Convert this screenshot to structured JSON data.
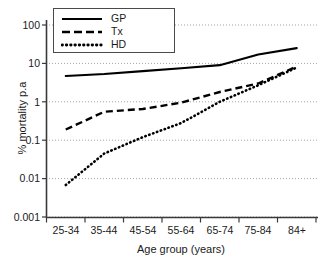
{
  "chart_data": {
    "type": "line",
    "title": "",
    "xlabel": "Age group (years)",
    "ylabel": "% mortality p.a",
    "categories": [
      "25-34",
      "35-44",
      "45-54",
      "55-64",
      "65-74",
      "75-84",
      "84+"
    ],
    "yscale": "log",
    "ylim": [
      0.001,
      100
    ],
    "yticks": [
      100,
      10,
      1,
      0.1,
      0.01,
      0.001
    ],
    "ytick_labels": [
      "100",
      "10",
      "1",
      "0.1",
      "0.01",
      "0.001"
    ],
    "grid": true,
    "grid_axis": "y",
    "legend_position": "top-left",
    "series": [
      {
        "name": "GP",
        "style": "solid",
        "color": "#000000",
        "values": [
          4.7,
          5.3,
          6.3,
          7.5,
          9.0,
          17.0,
          25.0
        ]
      },
      {
        "name": "Tx",
        "style": "dashed",
        "color": "#000000",
        "values": [
          0.19,
          0.55,
          0.65,
          0.95,
          1.8,
          3.0,
          8.3
        ]
      },
      {
        "name": "HD",
        "style": "dotted",
        "color": "#000000",
        "values": [
          0.0068,
          0.045,
          0.12,
          0.28,
          1.0,
          2.7,
          7.8
        ]
      }
    ]
  },
  "legend": {
    "items": [
      {
        "label": "GP",
        "style": "solid"
      },
      {
        "label": "Tx",
        "style": "dashed"
      },
      {
        "label": "HD",
        "style": "dotted"
      }
    ]
  },
  "axes": {
    "y_title": "% mortality p.a",
    "x_title": "Age group (years)",
    "y_tick_labels": [
      "100",
      "10",
      "1",
      "0.1",
      "0.01",
      "0.001"
    ],
    "x_tick_labels": [
      "25-34",
      "35-44",
      "45-54",
      "55-64",
      "65-74",
      "75-84",
      "84+"
    ]
  },
  "colors": {
    "series": "#000000",
    "axis": "#3a3a3a",
    "grid": "#9a9a9a",
    "background": "#ffffff"
  }
}
